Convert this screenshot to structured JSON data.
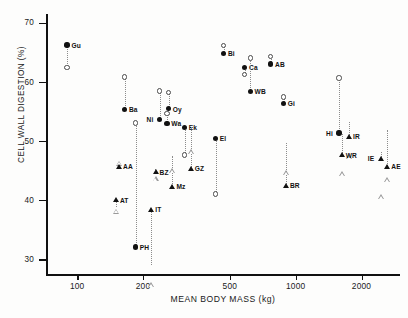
{
  "chart_data": {
    "type": "scatter",
    "title": "",
    "xlabel": "MEAN BODY MASS (kg)",
    "ylabel": "CELL WALL DIGESTION (%)",
    "xscale": "log",
    "xlim": [
      72,
      3000
    ],
    "ylim": [
      27.5,
      71.5
    ],
    "xticks": [
      100,
      200,
      500,
      1000,
      2000
    ],
    "xtick_labels": [
      "100",
      "200",
      "500",
      "1000",
      "2000"
    ],
    "yticks": [
      30,
      40,
      50,
      60,
      70
    ],
    "ytick_labels": [
      "30",
      "40",
      "50",
      "60",
      "70"
    ],
    "grid": false,
    "legend": "none",
    "marker_types": {
      "filled-circle": "observed value, group 1",
      "open-circle": "paired value, group 1",
      "filled-triangle": "observed value, group 2",
      "open-triangle": "paired value, group 2"
    },
    "points": [
      {
        "label": "Gu",
        "x": 90,
        "y_filled": 66.2,
        "y_open": 62.4,
        "marker": "circle",
        "label_side": "right"
      },
      {
        "label": "Ba",
        "x": 165,
        "y_filled": 55.3,
        "y_open": 60.8,
        "marker": "circle",
        "label_side": "right"
      },
      {
        "label": "Ni",
        "x": 238,
        "y_filled": 53.6,
        "y_open": 58.4,
        "marker": "circle",
        "label_side": "left"
      },
      {
        "label": "Oy",
        "x": 262,
        "y_filled": 55.4,
        "y_open": 58.2,
        "marker": "circle",
        "label_side": "right"
      },
      {
        "label": "Wa",
        "x": 258,
        "y_filled": 52.9,
        "y_open": 54.6,
        "marker": "circle",
        "label_side": "right"
      },
      {
        "label": "Ek",
        "x": 310,
        "y_filled": 52.3,
        "y_open": 47.6,
        "marker": "circle",
        "label_side": "right"
      },
      {
        "label": "Bi",
        "x": 468,
        "y_filled": 64.8,
        "y_open": 66.1,
        "marker": "circle",
        "label_side": "right"
      },
      {
        "label": "Ca",
        "x": 585,
        "y_filled": 62.4,
        "y_open": 61.2,
        "marker": "circle",
        "label_side": "right"
      },
      {
        "label": "WB",
        "x": 620,
        "y_filled": 58.3,
        "y_open": 64.0,
        "marker": "circle",
        "label_side": "right"
      },
      {
        "label": "AB",
        "x": 770,
        "y_filled": 63.0,
        "y_open": 64.2,
        "marker": "circle",
        "label_side": "right"
      },
      {
        "label": "Gi",
        "x": 880,
        "y_filled": 56.3,
        "y_open": 57.4,
        "marker": "circle",
        "label_side": "right"
      },
      {
        "label": "El",
        "x": 430,
        "y_filled": 50.4,
        "y_open": 41.0,
        "marker": "circle",
        "label_side": "right"
      },
      {
        "label": "Hi",
        "x": 1580,
        "y_filled": 51.3,
        "y_open": 60.6,
        "marker": "circle",
        "label_side": "left"
      },
      {
        "label": "PH",
        "x": 185,
        "y_filled": 32.0,
        "y_open": 53.0,
        "marker": "circle",
        "label_side": "right"
      },
      {
        "label": "AA",
        "x": 155,
        "y_filled": 45.7,
        "y_open": 46.2,
        "marker": "triangle",
        "label_side": "right"
      },
      {
        "label": "AT",
        "x": 150,
        "y_filled": 40.0,
        "y_open": 38.9,
        "marker": "triangle",
        "label_side": "right"
      },
      {
        "label": "BZ",
        "x": 228,
        "y_filled": 44.7,
        "y_open": 45.3,
        "marker": "triangle",
        "label_side": "right"
      },
      {
        "label": "Mz",
        "x": 272,
        "y_filled": 42.3,
        "y_open": 47.5,
        "marker": "triangle",
        "label_side": "right"
      },
      {
        "label": "IT",
        "x": 218,
        "y_filled": 38.4,
        "y_open": 29.0,
        "marker": "triangle",
        "label_side": "right"
      },
      {
        "label": "GZ",
        "x": 330,
        "y_filled": 45.3,
        "y_open": 52.4,
        "marker": "triangle",
        "label_side": "right"
      },
      {
        "label": "BR",
        "x": 900,
        "y_filled": 42.4,
        "y_open": 49.7,
        "marker": "triangle",
        "label_side": "right"
      },
      {
        "label": "IR",
        "x": 1750,
        "y_filled": 50.7,
        "y_open": 53.2,
        "marker": "triangle",
        "label_side": "right"
      },
      {
        "label": "WR",
        "x": 1620,
        "y_filled": 47.6,
        "y_open": 51.2,
        "marker": "triangle",
        "label_side": "right"
      },
      {
        "label": "IE",
        "x": 2450,
        "y_filled": 47.0,
        "y_open": 48.2,
        "marker": "triangle",
        "label_side": "left"
      },
      {
        "label": "AE",
        "x": 2620,
        "y_filled": 45.7,
        "y_open": 51.8,
        "marker": "triangle",
        "label_side": "right"
      }
    ]
  }
}
